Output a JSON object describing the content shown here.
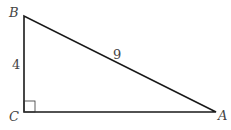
{
  "diagram": {
    "type": "right-triangle",
    "vertices": {
      "B": {
        "label": "B",
        "x": 24,
        "y": 16
      },
      "C": {
        "label": "C",
        "x": 24,
        "y": 112
      },
      "A": {
        "label": "A",
        "x": 216,
        "y": 112
      }
    },
    "sides": {
      "BC": {
        "label": "4"
      },
      "BA": {
        "label": "9"
      },
      "CA": {
        "label": ""
      }
    },
    "right_angle_at": "C",
    "stroke_color": "#1a1a1a",
    "label_color": "#444444"
  }
}
